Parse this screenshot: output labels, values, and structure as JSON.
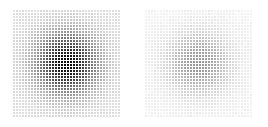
{
  "figure": {
    "background_color": "#ffffff",
    "width": 268,
    "height": 127,
    "panel_count": 2,
    "title": "",
    "caption": ""
  },
  "chart_data": {
    "type": "heatmap",
    "title": "",
    "subtitle": "",
    "xlabel": "",
    "ylabel": "",
    "grid": true,
    "legend": "none",
    "colormap": "greys",
    "cell_pitch_px": 3,
    "cell_size_px": 2,
    "panels": [
      {
        "name": "left-panel",
        "label": "",
        "x": 13,
        "y": 10,
        "width": 109,
        "height": 108,
        "cols": 36,
        "rows": 36,
        "center_col": 17.5,
        "center_row": 17.5,
        "sigma_cols": 7.0,
        "sigma_rows": 7.0,
        "peak_intensity": 1.0,
        "floor_intensity": 0.12,
        "min_gray_hex": "#0d0d0d",
        "max_gray_hex": "#e8e8e8",
        "xlim": [
          0,
          36
        ],
        "ylim": [
          0,
          36
        ]
      },
      {
        "name": "right-panel",
        "label": "",
        "x": 145,
        "y": 10,
        "width": 109,
        "height": 108,
        "cols": 36,
        "rows": 36,
        "center_col": 17.5,
        "center_row": 17.5,
        "sigma_cols": 7.0,
        "sigma_rows": 7.0,
        "peak_intensity": 0.42,
        "floor_intensity": 0.05,
        "min_gray_hex": "#9a9a9a",
        "max_gray_hex": "#f3f3f3",
        "xlim": [
          0,
          36
        ],
        "ylim": [
          0,
          36
        ]
      }
    ]
  }
}
